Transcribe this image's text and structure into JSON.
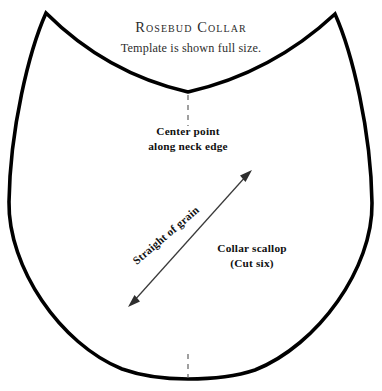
{
  "document": {
    "title": "Rosebud Collar",
    "subtitle": "Template is shown full size."
  },
  "annotations": {
    "center_point": {
      "line1": "Center point",
      "line2": "along neck edge"
    },
    "collar_scallop": {
      "line1": "Collar scallop",
      "line2": "(Cut six)"
    },
    "grain": {
      "label": "Straight of grain"
    }
  },
  "style": {
    "outline_color": "#000000",
    "outline_width": 3.6,
    "guide_color": "#555555",
    "arrow_color": "#3a3a3a",
    "background": "#ffffff",
    "title_color": "#2b2b2b"
  },
  "geometry": {
    "description": "Scalloped collar pattern piece: concave neck curve across the top between two sharp peaks, convex sides, rounded U-shaped bottom.",
    "left_peak": [
      46,
      13
    ],
    "right_peak": [
      335,
      14
    ],
    "neck_low_point": [
      188,
      92
    ],
    "bottom_point": [
      188,
      379
    ],
    "left_widest": [
      9,
      202
    ],
    "right_widest": [
      372,
      203
    ],
    "grain_arrow_start": [
      128,
      307
    ],
    "grain_arrow_end": [
      252,
      170
    ],
    "center_dash_top": [
      188,
      94,
      188,
      126
    ],
    "center_dash_bottom": [
      188,
      355,
      188,
      378
    ]
  }
}
